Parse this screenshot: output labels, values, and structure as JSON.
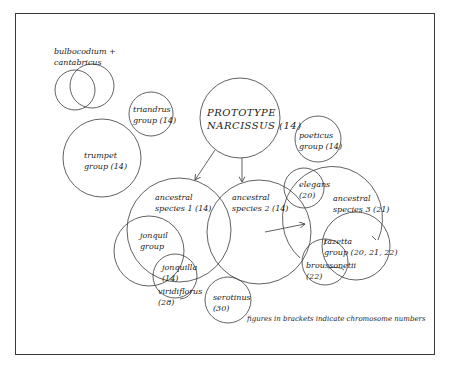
{
  "diagram": {
    "nodes": {
      "bulbocodium": {
        "line1": "bulbocodium +",
        "line2": "cantabricus"
      },
      "triandrus": {
        "line1": "triandrus",
        "line2": "group  (14)"
      },
      "trumpet": {
        "line1": "trumpet",
        "line2": "group  (14)"
      },
      "prototype": {
        "line1": "PROTOTYPE",
        "line2": "NARCISSUS  (14)"
      },
      "poeticus": {
        "line1": "poeticus",
        "line2": "group  (14)"
      },
      "ancestral1": {
        "line1": "ancestral",
        "line2": "species 1  (14)"
      },
      "ancestral2": {
        "line1": "ancestral",
        "line2": "species 2  (14)"
      },
      "ancestral3": {
        "line1": "ancestral",
        "line2": "species 3  (21)"
      },
      "elegans": {
        "line1": "elegans",
        "line2": "(20)"
      },
      "jonquil": {
        "line1": "jonquil",
        "line2": "group"
      },
      "jonquilla": {
        "line1": "jonquilla",
        "line2": "(14)"
      },
      "viridiflorus": {
        "line1": "viridiflorus",
        "line2": "(28)"
      },
      "serotinus": {
        "line1": "serotinus",
        "line2": "(30)"
      },
      "tazetta": {
        "line1": "tazetta",
        "line2": "group  (20, 21, 22)"
      },
      "broussonetii": {
        "line1": "broussonetii",
        "line2": "(22)"
      }
    },
    "note": "figures in brackets indicate chromosome numbers",
    "colors": {
      "stroke": "#3a3a3a",
      "text": "#222222",
      "frame": "#3a3a3a"
    }
  }
}
